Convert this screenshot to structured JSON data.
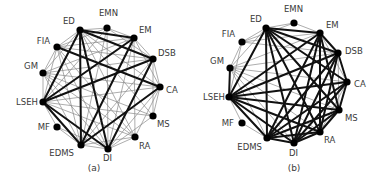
{
  "figure": {
    "graphs": [
      {
        "id": "a",
        "caption": "(a)",
        "caption_pos": [
          94,
          171
        ],
        "nodes": [
          {
            "name": "ED",
            "x": 80,
            "y": 30,
            "lx": 63,
            "ly": 24,
            "anchor": "start"
          },
          {
            "name": "EMN",
            "x": 107,
            "y": 28,
            "lx": 99,
            "ly": 16,
            "anchor": "start"
          },
          {
            "name": "EM",
            "x": 134,
            "y": 38,
            "lx": 139,
            "ly": 33,
            "anchor": "start"
          },
          {
            "name": "DSB",
            "x": 153,
            "y": 59,
            "lx": 158,
            "ly": 56,
            "anchor": "start"
          },
          {
            "name": "CA",
            "x": 160,
            "y": 87,
            "lx": 166,
            "ly": 93,
            "anchor": "start"
          },
          {
            "name": "MS",
            "x": 153,
            "y": 116,
            "lx": 157,
            "ly": 127,
            "anchor": "start"
          },
          {
            "name": "RA",
            "x": 135,
            "y": 137,
            "lx": 139,
            "ly": 149,
            "anchor": "start"
          },
          {
            "name": "DI",
            "x": 108,
            "y": 149,
            "lx": 103,
            "ly": 161,
            "anchor": "start"
          },
          {
            "name": "EDMS",
            "x": 81,
            "y": 145,
            "lx": 74,
            "ly": 156,
            "anchor": "end"
          },
          {
            "name": "MF",
            "x": 57,
            "y": 127,
            "lx": 50,
            "ly": 130,
            "anchor": "end"
          },
          {
            "name": "LSEH",
            "x": 43,
            "y": 102,
            "lx": 38,
            "ly": 105,
            "anchor": "end"
          },
          {
            "name": "GM",
            "x": 43,
            "y": 73,
            "lx": 38,
            "ly": 69,
            "anchor": "end"
          },
          {
            "name": "FIA",
            "x": 57,
            "y": 47,
            "lx": 50,
            "ly": 44,
            "anchor": "end"
          }
        ],
        "thick_edges": [
          [
            "ED",
            "EM"
          ],
          [
            "ED",
            "DSB"
          ],
          [
            "ED",
            "EDMS"
          ],
          [
            "ED",
            "DI"
          ],
          [
            "ED",
            "LSEH"
          ],
          [
            "FIA",
            "CA"
          ],
          [
            "EM",
            "LSEH"
          ],
          [
            "EM",
            "EDMS"
          ],
          [
            "DSB",
            "LSEH"
          ],
          [
            "DSB",
            "DI"
          ],
          [
            "CA",
            "EDMS"
          ],
          [
            "LSEH",
            "EDMS"
          ],
          [
            "LSEH",
            "DI"
          ]
        ],
        "thin_edges": [
          [
            "ED",
            "EMN"
          ],
          [
            "ED",
            "FIA"
          ],
          [
            "ED",
            "GM"
          ],
          [
            "ED",
            "CA"
          ],
          [
            "ED",
            "RA"
          ],
          [
            "ED",
            "MS"
          ],
          [
            "EMN",
            "EM"
          ],
          [
            "EMN",
            "FIA"
          ],
          [
            "EMN",
            "DSB"
          ],
          [
            "EMN",
            "LSEH"
          ],
          [
            "EMN",
            "EDMS"
          ],
          [
            "EMN",
            "DI"
          ],
          [
            "EM",
            "DSB"
          ],
          [
            "EM",
            "FIA"
          ],
          [
            "EM",
            "GM"
          ],
          [
            "EM",
            "DI"
          ],
          [
            "EM",
            "CA"
          ],
          [
            "EM",
            "RA"
          ],
          [
            "DSB",
            "CA"
          ],
          [
            "DSB",
            "FIA"
          ],
          [
            "DSB",
            "GM"
          ],
          [
            "DSB",
            "EDMS"
          ],
          [
            "DSB",
            "MS"
          ],
          [
            "CA",
            "MS"
          ],
          [
            "CA",
            "DI"
          ],
          [
            "CA",
            "RA"
          ],
          [
            "CA",
            "GM"
          ],
          [
            "CA",
            "LSEH"
          ],
          [
            "RA",
            "DI"
          ],
          [
            "RA",
            "EDMS"
          ],
          [
            "RA",
            "LSEH"
          ],
          [
            "RA",
            "GM"
          ],
          [
            "DI",
            "EDMS"
          ],
          [
            "DI",
            "GM"
          ],
          [
            "DI",
            "FIA"
          ],
          [
            "DI",
            "MS"
          ],
          [
            "EDMS",
            "LSEH"
          ],
          [
            "EDMS",
            "GM"
          ],
          [
            "EDMS",
            "FIA"
          ],
          [
            "EDMS",
            "MF"
          ],
          [
            "LSEH",
            "GM"
          ],
          [
            "LSEH",
            "FIA"
          ],
          [
            "LSEH",
            "MF"
          ],
          [
            "LSEH",
            "MS"
          ],
          [
            "GM",
            "FIA"
          ],
          [
            "MF",
            "DI"
          ],
          [
            "FIA",
            "RA"
          ],
          [
            "GM",
            "MS"
          ]
        ]
      },
      {
        "id": "b",
        "caption": "(b)",
        "caption_pos": [
          294,
          171
        ],
        "nodes": [
          {
            "name": "ED",
            "x": 266,
            "y": 28,
            "lx": 250,
            "ly": 22,
            "anchor": "start"
          },
          {
            "name": "EMN",
            "x": 294,
            "y": 23,
            "lx": 284,
            "ly": 12,
            "anchor": "start"
          },
          {
            "name": "EM",
            "x": 320,
            "y": 33,
            "lx": 326,
            "ly": 28,
            "anchor": "start"
          },
          {
            "name": "DSB",
            "x": 338,
            "y": 53,
            "lx": 345,
            "ly": 54,
            "anchor": "start"
          },
          {
            "name": "CA",
            "x": 347,
            "y": 82,
            "lx": 354,
            "ly": 87,
            "anchor": "start"
          },
          {
            "name": "MS",
            "x": 339,
            "y": 110,
            "lx": 345,
            "ly": 121,
            "anchor": "start"
          },
          {
            "name": "RA",
            "x": 320,
            "y": 132,
            "lx": 324,
            "ly": 143,
            "anchor": "start"
          },
          {
            "name": "DI",
            "x": 294,
            "y": 143,
            "lx": 289,
            "ly": 156,
            "anchor": "start"
          },
          {
            "name": "EDMS",
            "x": 267,
            "y": 138,
            "lx": 262,
            "ly": 150,
            "anchor": "end"
          },
          {
            "name": "MF",
            "x": 242,
            "y": 123,
            "lx": 234,
            "ly": 126,
            "anchor": "end"
          },
          {
            "name": "LSEH",
            "x": 229,
            "y": 97,
            "lx": 225,
            "ly": 100,
            "anchor": "end"
          },
          {
            "name": "GM",
            "x": 230,
            "y": 68,
            "lx": 224,
            "ly": 64,
            "anchor": "end"
          },
          {
            "name": "FIA",
            "x": 242,
            "y": 42,
            "lx": 235,
            "ly": 37,
            "anchor": "end"
          }
        ],
        "thick_edges": [
          [
            "ED",
            "EM"
          ],
          [
            "ED",
            "DSB"
          ],
          [
            "ED",
            "CA"
          ],
          [
            "ED",
            "MS"
          ],
          [
            "ED",
            "RA"
          ],
          [
            "ED",
            "DI"
          ],
          [
            "ED",
            "EDMS"
          ],
          [
            "ED",
            "LSEH"
          ],
          [
            "EM",
            "DSB"
          ],
          [
            "EM",
            "MS"
          ],
          [
            "EM",
            "RA"
          ],
          [
            "EM",
            "DI"
          ],
          [
            "EM",
            "EDMS"
          ],
          [
            "EM",
            "LSEH"
          ],
          [
            "DSB",
            "CA"
          ],
          [
            "DSB",
            "RA"
          ],
          [
            "DSB",
            "DI"
          ],
          [
            "DSB",
            "EDMS"
          ],
          [
            "DSB",
            "LSEH"
          ],
          [
            "CA",
            "MS"
          ],
          [
            "CA",
            "DI"
          ],
          [
            "CA",
            "EDMS"
          ],
          [
            "CA",
            "LSEH"
          ],
          [
            "MS",
            "RA"
          ],
          [
            "MS",
            "DI"
          ],
          [
            "MS",
            "EDMS"
          ],
          [
            "MS",
            "LSEH"
          ],
          [
            "RA",
            "DI"
          ],
          [
            "RA",
            "EDMS"
          ],
          [
            "RA",
            "LSEH"
          ],
          [
            "DI",
            "EDMS"
          ],
          [
            "DI",
            "LSEH"
          ],
          [
            "EDMS",
            "LSEH"
          ],
          [
            "LSEH",
            "GM"
          ]
        ],
        "thin_edges": [
          [
            "ED",
            "EMN"
          ],
          [
            "ED",
            "FIA"
          ],
          [
            "ED",
            "GM"
          ],
          [
            "EMN",
            "EM"
          ],
          [
            "EMN",
            "FIA"
          ],
          [
            "FIA",
            "GM"
          ],
          [
            "FIA",
            "LSEH"
          ],
          [
            "FIA",
            "EM"
          ],
          [
            "FIA",
            "DSB"
          ],
          [
            "GM",
            "EM"
          ],
          [
            "GM",
            "DSB"
          ],
          [
            "GM",
            "CA"
          ],
          [
            "GM",
            "MS"
          ],
          [
            "GM",
            "RA"
          ],
          [
            "GM",
            "DI"
          ],
          [
            "GM",
            "EDMS"
          ],
          [
            "MF",
            "LSEH"
          ],
          [
            "MF",
            "EDMS"
          ],
          [
            "CA",
            "RA"
          ],
          [
            "DSB",
            "MS"
          ],
          [
            "EM",
            "CA"
          ]
        ]
      }
    ]
  }
}
